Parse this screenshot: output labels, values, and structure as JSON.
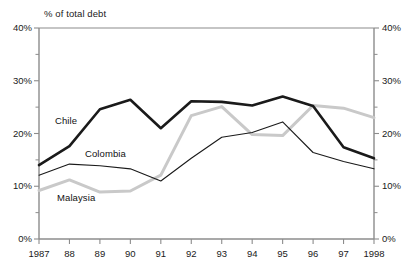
{
  "chart_data": {
    "type": "line",
    "title": "",
    "subtitle": "",
    "ylabel": "% of total debt",
    "xlabel": "",
    "ylim": [
      0,
      40
    ],
    "ytick_values": [
      0,
      10,
      20,
      30,
      40
    ],
    "ytick_labels_left": [
      "0%",
      "10%",
      "20%",
      "30%",
      "40%"
    ],
    "ytick_labels_right": [
      "0%",
      "10%",
      "20%",
      "30%",
      "40%"
    ],
    "minor_ytick_values": [
      5,
      15,
      25,
      35
    ],
    "grid": false,
    "legend_position": "inline-labels",
    "x": [
      1987,
      1988,
      1989,
      1990,
      1991,
      1992,
      1993,
      1994,
      1995,
      1996,
      1997,
      1998
    ],
    "categories": [
      "1987",
      "88",
      "89",
      "90",
      "91",
      "92",
      "93",
      "94",
      "95",
      "96",
      "97",
      "1998"
    ],
    "series": [
      {
        "name": "Chile",
        "color": "#1a1a1a",
        "width": 2.6,
        "values": [
          14.0,
          17.6,
          24.6,
          26.4,
          21.0,
          26.1,
          26.0,
          25.3,
          27.0,
          25.2,
          17.4,
          15.3
        ]
      },
      {
        "name": "Colombia",
        "color": "#1a1a1a",
        "width": 1.1,
        "values": [
          12.1,
          14.2,
          13.9,
          13.3,
          11.0,
          15.3,
          19.3,
          20.2,
          22.2,
          16.4,
          14.7,
          13.3
        ]
      },
      {
        "name": "Malaysia",
        "color": "#c9c9c9",
        "width": 3.0,
        "values": [
          9.2,
          11.2,
          8.9,
          9.1,
          12.1,
          23.4,
          25.1,
          19.8,
          19.6,
          25.3,
          24.8,
          23.0
        ]
      }
    ]
  },
  "annotations": {
    "chile_label": "Chile",
    "colombia_label": "Colombia",
    "malaysia_label": "Malaysia"
  },
  "colors": {
    "axis": "#8c8c8c",
    "text": "#1a1a1a",
    "chile": "#1a1a1a",
    "colombia": "#1a1a1a",
    "malaysia": "#c9c9c9",
    "background": "#ffffff"
  }
}
